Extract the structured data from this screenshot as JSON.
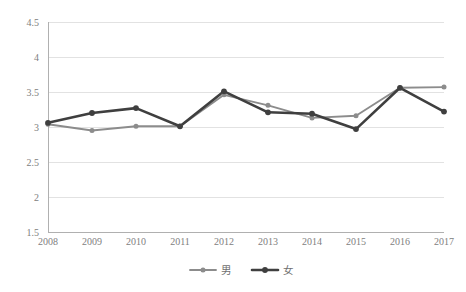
{
  "chart_data": {
    "type": "line",
    "title": "",
    "subtitle": "",
    "xlabel": "",
    "ylabel": "",
    "categories": [
      "2008",
      "2009",
      "2010",
      "2011",
      "2012",
      "2013",
      "2014",
      "2015",
      "2016",
      "2017"
    ],
    "x": [
      2008,
      2009,
      2010,
      2011,
      2012,
      2013,
      2014,
      2015,
      2016,
      2017
    ],
    "series": [
      {
        "name": "男",
        "color": "#8c8c8c",
        "marker": "circle",
        "values": [
          3.04,
          2.95,
          3.01,
          3.01,
          3.46,
          3.31,
          3.13,
          3.16,
          3.56,
          3.57
        ]
      },
      {
        "name": "女",
        "color": "#3f3f3f",
        "marker": "circle",
        "values": [
          3.06,
          3.2,
          3.27,
          3.01,
          3.51,
          3.21,
          3.19,
          2.97,
          3.56,
          3.22
        ]
      }
    ],
    "ylim": [
      1.5,
      4.5
    ],
    "ytick_values": [
      1.5,
      2,
      2.5,
      3,
      3.5,
      4,
      4.5
    ],
    "ytick_labels": [
      "1.5",
      "2",
      "2.5",
      "3",
      "3.5",
      "4",
      "4.5"
    ],
    "xtick_labels": [
      "2008",
      "2009",
      "2010",
      "2011",
      "2012",
      "2013",
      "2014",
      "2015",
      "2016",
      "2017"
    ],
    "grid": true,
    "grid_axis": "y",
    "legend_position": "bottom",
    "legend_entries": [
      "男",
      "女"
    ],
    "colors": {
      "series_male": "#8c8c8c",
      "series_female": "#3f3f3f",
      "gridline": "#e2e2e2",
      "axis": "#b0b0b0",
      "tick_text": "#808080",
      "background": "#ffffff"
    }
  }
}
